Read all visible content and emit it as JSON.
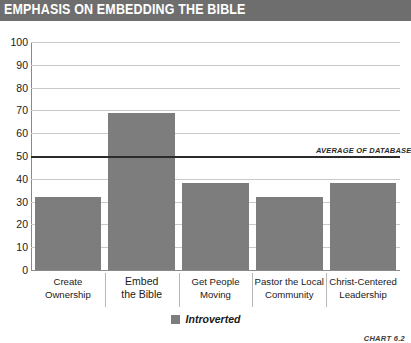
{
  "header": {
    "title": "EMPHASIS ON EMBEDDING THE BIBLE"
  },
  "footer": {
    "chart_number": "CHART 6.2"
  },
  "legend": {
    "swatch_name": "legend-color-swatch",
    "label": "Introverted"
  },
  "annotation": {
    "average_label": "AVERAGE OF DATABASE"
  },
  "colors": {
    "banner": "#6e6e6e",
    "bar": "#7d7d7d",
    "average_line": "#2b2b2b",
    "gridline": "#c9c9c9"
  },
  "chart_data": {
    "type": "bar",
    "title": "EMPHASIS ON EMBEDDING THE BIBLE",
    "xlabel": "",
    "ylabel": "",
    "ylim": [
      0,
      100
    ],
    "yticks": [
      0,
      10,
      20,
      30,
      40,
      50,
      60,
      70,
      80,
      90,
      100
    ],
    "ytick_labels": [
      "0",
      "10",
      "20",
      "30",
      "40",
      "50",
      "60",
      "70",
      "80",
      "90",
      "100"
    ],
    "grid": true,
    "legend_position": "bottom-center",
    "categories": [
      "Create Ownership",
      "Embed the Bible",
      "Get People Moving",
      "Pastor the Local Community",
      "Christ-Centered Leadership"
    ],
    "category_lines": [
      [
        "Create",
        "Ownership"
      ],
      [
        "Embed",
        "the Bible"
      ],
      [
        "Get People",
        "Moving"
      ],
      [
        "Pastor the Local",
        "Community"
      ],
      [
        "Christ-Centered",
        "Leadership"
      ]
    ],
    "series": [
      {
        "name": "Introverted",
        "values": [
          32,
          69,
          38,
          32,
          38
        ]
      }
    ],
    "reference_line": {
      "label": "AVERAGE OF DATABASE",
      "value": 50
    }
  }
}
